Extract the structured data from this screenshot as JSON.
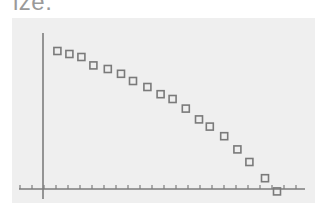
{
  "caption": "ize.",
  "colors": {
    "panel_bg": "#efefef",
    "axis": "#7d7d7d",
    "marker_stroke": "#7a7a7a",
    "caption": "#9a9a9a"
  },
  "chart_data": {
    "type": "scatter",
    "title": "",
    "xlabel": "",
    "ylabel": "",
    "marker": "hollow-square",
    "grid": false,
    "legend": null,
    "x_ticks_count": 24,
    "tick_labels": [],
    "xlim": [
      -2,
      22
    ],
    "ylim": [
      -1,
      13
    ],
    "points": [
      {
        "x": 1.2,
        "y": 11.5
      },
      {
        "x": 2.2,
        "y": 11.25
      },
      {
        "x": 3.2,
        "y": 11.0
      },
      {
        "x": 4.2,
        "y": 10.3
      },
      {
        "x": 5.4,
        "y": 10.0
      },
      {
        "x": 6.5,
        "y": 9.6
      },
      {
        "x": 7.5,
        "y": 9.0
      },
      {
        "x": 8.7,
        "y": 8.5
      },
      {
        "x": 9.8,
        "y": 7.9
      },
      {
        "x": 10.8,
        "y": 7.5
      },
      {
        "x": 11.9,
        "y": 6.7
      },
      {
        "x": 13.0,
        "y": 5.8
      },
      {
        "x": 13.9,
        "y": 5.2
      },
      {
        "x": 15.1,
        "y": 4.4
      },
      {
        "x": 16.2,
        "y": 3.3
      },
      {
        "x": 17.2,
        "y": 2.25
      },
      {
        "x": 18.5,
        "y": 0.9
      },
      {
        "x": 19.5,
        "y": -0.2
      }
    ]
  }
}
